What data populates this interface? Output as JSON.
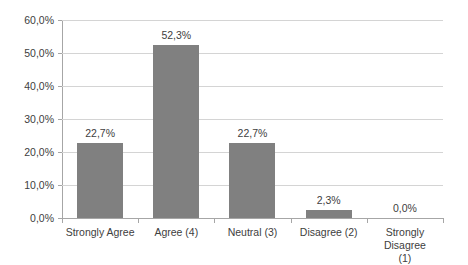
{
  "chart_data": {
    "type": "bar",
    "title": "",
    "subtitle": "",
    "xlabel": "",
    "ylabel": "",
    "categories": [
      "Strongly Agree",
      "Agree (4)",
      "Neutral (3)",
      "Disagree (2)",
      "Strongly Disagree (1)"
    ],
    "category_lines": [
      [
        "Strongly Agree"
      ],
      [
        "Agree (4)"
      ],
      [
        "Neutral (3)"
      ],
      [
        "Disagree (2)"
      ],
      [
        "Strongly Disagree",
        "(1)"
      ]
    ],
    "values": [
      22.7,
      52.3,
      22.7,
      2.3,
      0.0
    ],
    "data_labels": [
      "22,7%",
      "52,3%",
      "22,7%",
      "2,3%",
      "0,0%"
    ],
    "ylim": [
      0,
      60
    ],
    "ytick_values": [
      0,
      10,
      20,
      30,
      40,
      50,
      60
    ],
    "ytick_labels": [
      "0,0%",
      "10,0%",
      "20,0%",
      "30,0%",
      "40,0%",
      "50,0%",
      "60,0%"
    ],
    "grid": true,
    "legend": false,
    "decimal_separator": ",",
    "series": [
      {
        "name": "",
        "values": [
          22.7,
          52.3,
          22.7,
          2.3,
          0.0
        ]
      }
    ],
    "colors": {
      "bar": "#808080",
      "gridline": "#d4d4d4",
      "axis": "#a6a6a6",
      "text": "#404040",
      "background": "#ffffff"
    }
  }
}
